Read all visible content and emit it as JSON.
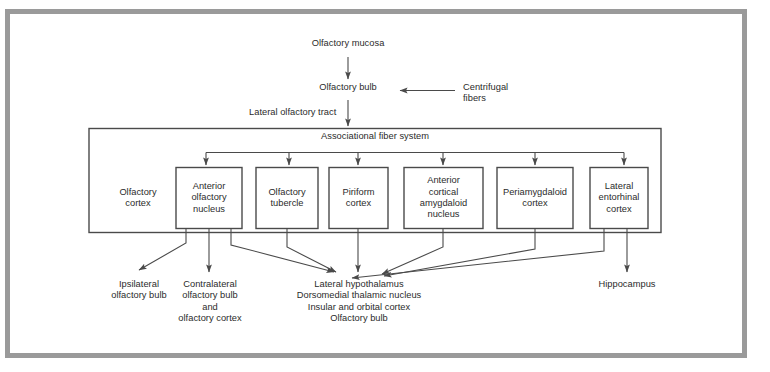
{
  "figure": {
    "title_nodes": {
      "olfactory_mucosa": "Olfactory mucosa",
      "olfactory_bulb": "Olfactory bulb",
      "centrifugal_fibers": "Centrifugal\nfibers",
      "lateral_olfactory_tract": "Lateral olfactory tract",
      "associational_fiber_system": "Associational fiber system",
      "olfactory_cortex_group": "Olfactory\ncortex"
    },
    "cortex_boxes": [
      {
        "id": "anterior-olfactory-nucleus",
        "label": "Anterior\nolfactory\nnucleus"
      },
      {
        "id": "olfactory-tubercle",
        "label": "Olfactory\ntubercle"
      },
      {
        "id": "piriform-cortex",
        "label": "Piriform\ncortex"
      },
      {
        "id": "anterior-cortical-amygdaloid-nucleus",
        "label": "Anterior\ncortical\namygdaloid\nnucleus"
      },
      {
        "id": "periamygdaloid-cortex",
        "label": "Periamygdaloid\ncortex"
      },
      {
        "id": "lateral-entorhinal-cortex",
        "label": "Lateral\nentorhinal\ncortex"
      }
    ],
    "targets": [
      {
        "id": "ipsilateral-olfactory-bulb",
        "label": "Ipsilateral\nolfactory bulb"
      },
      {
        "id": "contralateral-olfactory-bulb-and-olfactory-cortex",
        "label": "Contralateral\nolfactory bulb\nand\nolfactory cortex"
      },
      {
        "id": "lateral-hypothalamus-group",
        "label": "Lateral hypothalamus\nDorsomedial thalamic nucleus\nInsular and orbital cortex\nOlfactory bulb"
      },
      {
        "id": "hippocampus",
        "label": "Hippocampus"
      }
    ],
    "colors": {
      "frame": "#9a9a9a",
      "line": "#4a4a4a",
      "box_border": "#4a4a4a",
      "text": "#2b2b2b",
      "background": "#ffffff"
    }
  }
}
